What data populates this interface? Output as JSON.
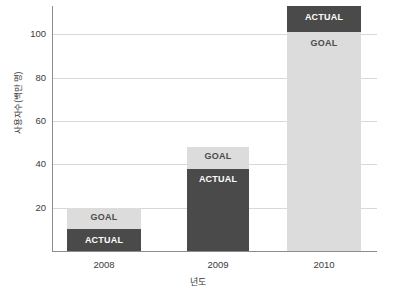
{
  "chart_data": {
    "type": "bar",
    "title": "",
    "subtitle": "",
    "xlabel": "년도",
    "ylabel": "사용자수(백만 명)",
    "categories": [
      "2008",
      "2009",
      "2010"
    ],
    "series": [
      {
        "name": "GOAL",
        "values": [
          20,
          48,
          101
        ]
      },
      {
        "name": "ACTUAL",
        "values": [
          10,
          38,
          113
        ]
      }
    ],
    "bars": [
      {
        "category": "2008",
        "goal": 20,
        "actual": 10,
        "goal_label": "GOAL",
        "actual_label": "ACTUAL",
        "actual_exceeds_goal": false
      },
      {
        "category": "2009",
        "goal": 48,
        "actual": 38,
        "goal_label": "GOAL",
        "actual_label": "ACTUAL",
        "actual_exceeds_goal": false
      },
      {
        "category": "2010",
        "goal": 101,
        "actual": 113,
        "goal_label": "GOAL",
        "actual_label": "ACTUAL",
        "actual_exceeds_goal": true
      }
    ],
    "ylim": [
      0,
      113
    ],
    "yticks": [
      20,
      40,
      60,
      80,
      100
    ],
    "ytick_labels": [
      "20",
      "40",
      "60",
      "80",
      "100"
    ],
    "grid": true,
    "legend": "none",
    "legend_position": "in-bar-labels",
    "colors": {
      "goal": "#dcdcdc",
      "actual": "#4a4a4a",
      "gridline": "#d8d8d8",
      "axis": "#8c8c8c",
      "text": "#3a3a3a",
      "background": "#ffffff"
    }
  }
}
